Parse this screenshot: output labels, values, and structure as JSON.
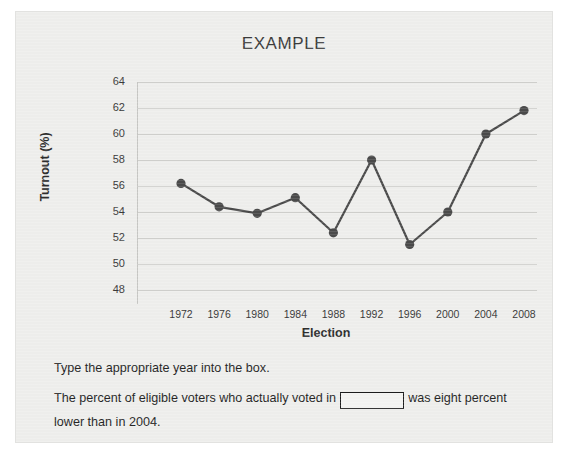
{
  "chart_data": {
    "type": "line",
    "title": "EXAMPLE",
    "xlabel": "Election",
    "ylabel": "Turnout (%)",
    "categories": [
      "1972",
      "1976",
      "1980",
      "1984",
      "1988",
      "1992",
      "1996",
      "2000",
      "2004",
      "2008"
    ],
    "values": [
      56.2,
      54.4,
      53.9,
      55.1,
      52.4,
      58.0,
      51.5,
      54.0,
      60.0,
      61.8
    ],
    "yticks": [
      48,
      50,
      52,
      54,
      56,
      58,
      60,
      62,
      64
    ],
    "ylim": [
      48,
      64
    ],
    "grid": true,
    "legend": null,
    "series_color": "#4a4a4a",
    "marker": "circle"
  },
  "question": {
    "line1": "Type the appropriate year into the box.",
    "line2_before": "The percent of eligible voters who actually voted in",
    "line2_after": "was eight percent",
    "line3": "lower than in 2004.",
    "answer_value": "",
    "answer_placeholder": ""
  },
  "colors": {
    "panel_background": "#eeeeec",
    "page_background": "#ffffff",
    "gridline": "#cfcfcc",
    "text": "#262626",
    "series": "#4a4a4a"
  }
}
